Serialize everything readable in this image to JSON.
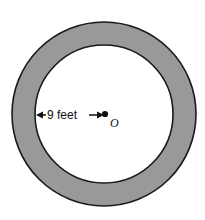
{
  "figure": {
    "type": "annulus-diagram",
    "background_color": "#FFFFFF"
  },
  "geometry": {
    "center": {
      "x": 104,
      "y": 114
    },
    "outer_radius": 92,
    "inner_radius": 69,
    "ring_width": 23
  },
  "styles": {
    "ring_fill_color": "#999999",
    "inner_disk_fill_color": "#FFFFFF",
    "stroke_color": "#1A1A1A",
    "stroke_width": 1.6,
    "annotation_color": "#111111"
  },
  "annotations": {
    "radius_label": "9 feet",
    "radius_value": 9,
    "radius_units": "feet",
    "center_label": "O",
    "dimension_line": {
      "start_x": 36,
      "end_x": 104,
      "y": 115,
      "left_arrow": "arrow-left",
      "right_arrow": "arrow-right"
    },
    "center_dot_radius": 3.1
  }
}
